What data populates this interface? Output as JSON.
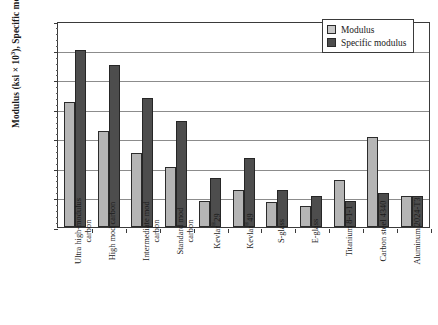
{
  "chart_data": {
    "type": "bar",
    "title": "",
    "xlabel": "",
    "ylabel": "Modulus (ksi × 10³), Specific modulus (10⁷ in.)",
    "ylabel_parts": {
      "a": "Modulus (ksi × 10",
      "a_sup": "3",
      "b": "), Specific modulus (10",
      "b_sup": "7",
      "c": " in.)"
    },
    "ylim": [
      0,
      70
    ],
    "yticks": [
      0,
      10,
      20,
      30,
      40,
      50,
      60,
      70
    ],
    "grid": true,
    "legend_position": "top-right",
    "categories": [
      "Ultra high-modulus carbon",
      "High mod carbon",
      "Intermediate mod carbon",
      "Standard mod carbon",
      "Kevlar®29",
      "Kevlar®49",
      "S-glass",
      "E-glass",
      "Titanium 8-1-1",
      "Carbon steel 4340",
      "Aluminum 2024-T3"
    ],
    "category_lines": [
      [
        "Ultra high-modulus",
        "carbon"
      ],
      [
        "High mod carbon"
      ],
      [
        "Intermediate mod",
        "carbon"
      ],
      [
        "Standard mod",
        "carbon"
      ],
      [
        "Kevlar®29"
      ],
      [
        "Kevlar®49"
      ],
      [
        "S-glass"
      ],
      [
        "E-glass"
      ],
      [
        "Titanium 8-1-1"
      ],
      [
        "Carbon steel 4340"
      ],
      [
        "Aluminum 2024-T3"
      ]
    ],
    "series": [
      {
        "name": "Modulus",
        "color": "#b5b5b5",
        "values": [
          42.5,
          32.5,
          25.0,
          20.5,
          9.0,
          12.5,
          8.5,
          7.0,
          16.0,
          30.5,
          10.5
        ]
      },
      {
        "name": "Specific modulus",
        "color": "#4d4d4d",
        "values": [
          60.0,
          55.0,
          44.0,
          36.0,
          16.5,
          23.5,
          12.5,
          10.5,
          9.0,
          11.5,
          10.5
        ]
      }
    ]
  },
  "legend": {
    "items": [
      {
        "label": "Modulus",
        "color": "#c9c9c9"
      },
      {
        "label": "Specific modulus",
        "color": "#4d4d4d"
      }
    ]
  }
}
